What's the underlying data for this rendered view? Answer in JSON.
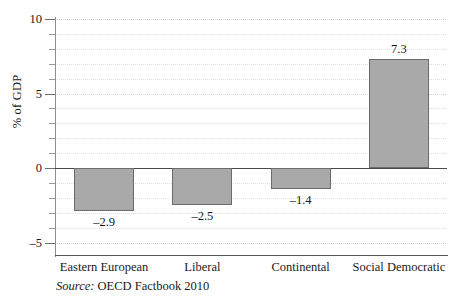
{
  "chart_data": {
    "type": "bar",
    "title": "",
    "xlabel": "",
    "ylabel": "% of GDP",
    "categories": [
      "Eastern European",
      "Liberal",
      "Continental",
      "Social Democratic"
    ],
    "values": [
      -2.9,
      -2.5,
      -1.4,
      7.3
    ],
    "value_labels": [
      "–2.9",
      "–2.5",
      "–1.4",
      "7.3"
    ],
    "ylim": [
      -5.8,
      10.6
    ],
    "ytick_values": [
      10,
      5,
      0,
      -5
    ],
    "ytick_labels": [
      "10",
      "5",
      "0",
      "–5"
    ],
    "minor_tick_step": 1,
    "grid": true,
    "grid_style": "dotted",
    "legend": "none",
    "bar_fill_color": "#a9a9a9",
    "bar_edge_color": "#6b6b6b",
    "grid_color": "#dedede",
    "axis_color": "#555555"
  },
  "source_note": {
    "keyword": "Source:",
    "text": " OECD Factbook 2010"
  }
}
